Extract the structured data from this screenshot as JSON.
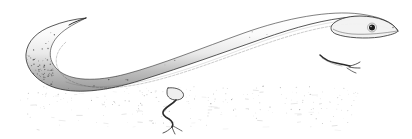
{
  "figure": {
    "type": "pen-and-ink stipple illustration",
    "subject": "lizard",
    "common_name": "skink",
    "background_color": "#ffffff",
    "ink_color": "#262626",
    "mid_tone_color": "#8a8a8a",
    "light_tone_color": "#c8c8c8",
    "alt_text": "Black and white stippled line drawing of an elongated lizard with a long tail curving in a U shape to the left, very small limbs, and a pointed head facing right.",
    "canvas": {
      "width": 412,
      "height": 139
    }
  },
  "anatomy": {
    "head": {
      "label": "head",
      "snout_tip": {
        "x": 398,
        "y": 31
      },
      "base": {
        "x": 340,
        "y": 30
      }
    },
    "eye": {
      "label": "eye",
      "center": {
        "x": 372,
        "y": 28
      },
      "radius": 3.4,
      "pupil_color": "#1c1c1c",
      "ring_color": "#ffffff"
    },
    "body": {
      "label": "body",
      "dorsal_shade": "light",
      "ventral_shade": "dark"
    },
    "tail": {
      "label": "tail",
      "curve": "U-shaped to the left",
      "tip": {
        "x": 86,
        "y": 18
      },
      "leftmost_x": 18
    },
    "forelimb": {
      "label": "forelimb",
      "attach": {
        "x": 322,
        "y": 57
      },
      "foot": {
        "x": 349,
        "y": 66
      },
      "size": "reduced"
    },
    "hindlimb": {
      "label": "hindlimb",
      "attach": {
        "x": 176,
        "y": 93
      },
      "foot": {
        "x": 171,
        "y": 126
      },
      "size": "reduced"
    },
    "ground": {
      "label": "ground shadow",
      "style": "sparse stipple"
    }
  },
  "render": {
    "stipple_seed": 20240513,
    "body_stipple_count": 5200,
    "ground_stipple_count": 520,
    "tail_stipple_count": 1400
  }
}
